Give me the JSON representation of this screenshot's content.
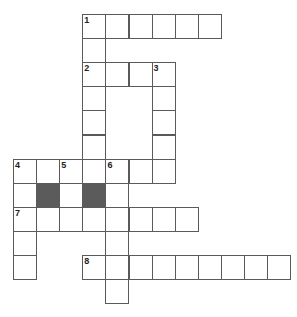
{
  "puzzle": {
    "type": "crossword",
    "cell_width": 23.1,
    "cell_height": 24.1,
    "origin_x": 13,
    "origin_y": 14,
    "colors": {
      "line": "#5a5a5a",
      "block": "#5b5b5b",
      "cell": "#ffffff",
      "number": "#222222"
    },
    "entries": [
      {
        "number": "1",
        "direction": "across",
        "row": 0,
        "col": 3,
        "length": 6
      },
      {
        "number": "1",
        "direction": "down",
        "row": 0,
        "col": 3,
        "length": 7
      },
      {
        "number": "2",
        "direction": "across",
        "row": 2,
        "col": 3,
        "length": 4
      },
      {
        "number": "3",
        "direction": "down",
        "row": 2,
        "col": 6,
        "length": 5
      },
      {
        "number": "4",
        "direction": "across",
        "row": 6,
        "col": 0,
        "length": 7
      },
      {
        "number": "4",
        "direction": "down",
        "row": 6,
        "col": 0,
        "length": 5
      },
      {
        "number": "5",
        "direction": "down",
        "row": 6,
        "col": 2,
        "length": 3
      },
      {
        "number": "6",
        "direction": "down",
        "row": 6,
        "col": 4,
        "length": 6
      },
      {
        "number": "7",
        "direction": "across",
        "row": 8,
        "col": 0,
        "length": 8
      },
      {
        "number": "8",
        "direction": "across",
        "row": 10,
        "col": 3,
        "length": 9
      }
    ],
    "blocks": [
      {
        "row": 7,
        "col": 1
      },
      {
        "row": 7,
        "col": 3
      }
    ],
    "numbers": [
      {
        "label": "1",
        "row": 0,
        "col": 3
      },
      {
        "label": "2",
        "row": 2,
        "col": 3
      },
      {
        "label": "3",
        "row": 2,
        "col": 6
      },
      {
        "label": "4",
        "row": 6,
        "col": 0
      },
      {
        "label": "5",
        "row": 6,
        "col": 2
      },
      {
        "label": "6",
        "row": 6,
        "col": 4
      },
      {
        "label": "7",
        "row": 8,
        "col": 0
      },
      {
        "label": "8",
        "row": 10,
        "col": 3
      }
    ]
  }
}
